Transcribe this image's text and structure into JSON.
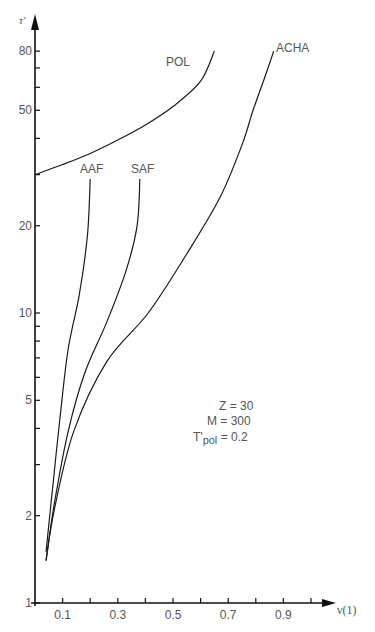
{
  "chart_data": {
    "type": "line",
    "title": "",
    "xlabel": "ν(1)",
    "ylabel": "τ'",
    "xscale": "linear",
    "yscale": "log",
    "xlim": [
      0,
      1.05
    ],
    "ylim": [
      1,
      95
    ],
    "grid": false,
    "x_ticks": [
      0.1,
      0.2,
      0.3,
      0.4,
      0.5,
      0.6,
      0.7,
      0.8,
      0.9,
      1.0
    ],
    "x_tick_labels": [
      "0.1",
      "",
      "0.3",
      "",
      "0.5",
      "",
      "0.7",
      "",
      "0.9",
      ""
    ],
    "y_ticks": [
      1,
      2,
      3,
      4,
      5,
      6,
      7,
      8,
      9,
      10,
      20,
      30,
      40,
      50,
      60,
      70,
      80
    ],
    "y_tick_labels": [
      "1",
      "2",
      "",
      "",
      "5",
      "",
      "",
      "",
      "",
      "10",
      "20",
      "",
      "",
      "50",
      "",
      "",
      "80"
    ],
    "series": [
      {
        "name": "POL",
        "points": [
          [
            0.0,
            30
          ],
          [
            0.1,
            32.5
          ],
          [
            0.2,
            35.5
          ],
          [
            0.3,
            39.5
          ],
          [
            0.4,
            44.5
          ],
          [
            0.5,
            51.5
          ],
          [
            0.6,
            63
          ],
          [
            0.65,
            80
          ]
        ]
      },
      {
        "name": "AAF",
        "points": [
          [
            0.04,
            1.5
          ],
          [
            0.06,
            2.3
          ],
          [
            0.09,
            4.3
          ],
          [
            0.12,
            7.5
          ],
          [
            0.16,
            11.5
          ],
          [
            0.19,
            18.5
          ],
          [
            0.2,
            29
          ]
        ]
      },
      {
        "name": "SAF",
        "points": [
          [
            0.04,
            1.4
          ],
          [
            0.07,
            2.2
          ],
          [
            0.12,
            3.9
          ],
          [
            0.18,
            6.2
          ],
          [
            0.26,
            9.3
          ],
          [
            0.33,
            14
          ],
          [
            0.37,
            20
          ],
          [
            0.38,
            29
          ]
        ]
      },
      {
        "name": "ACHA",
        "points": [
          [
            0.04,
            1.4
          ],
          [
            0.07,
            2.1
          ],
          [
            0.14,
            3.9
          ],
          [
            0.26,
            6.8
          ],
          [
            0.41,
            10
          ],
          [
            0.55,
            16
          ],
          [
            0.67,
            25
          ],
          [
            0.75,
            38
          ],
          [
            0.79,
            50
          ],
          [
            0.83,
            64
          ],
          [
            0.865,
            80
          ]
        ]
      }
    ],
    "annotations": [
      "Z = 30",
      "M = 300",
      "T'pol = 0.2"
    ]
  },
  "labels": {
    "ylabel": "τ'",
    "xlabel": "ν(1)",
    "series": {
      "POL": "POL",
      "AAF": "AAF",
      "SAF": "SAF",
      "ACHA": "ACHA"
    },
    "params": {
      "z": "Z = 30",
      "m": "M = 300",
      "t_main": "T'",
      "t_sub": "pol",
      "t_val": " = 0.2"
    }
  }
}
